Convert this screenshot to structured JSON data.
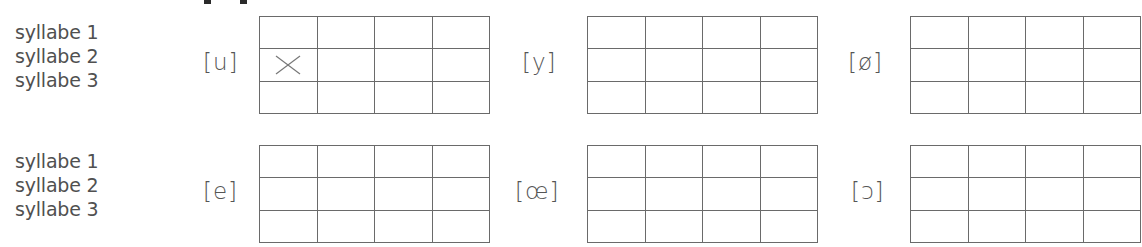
{
  "exercise": {
    "rows": [
      {
        "syllable_labels": [
          "syllabe 1",
          "syllabe 2",
          "syllabe 3"
        ],
        "grids": [
          {
            "phoneme": "[u]",
            "columns": 4,
            "rows": 3,
            "marks": [
              {
                "row": 2,
                "col": 1,
                "symbol": "×"
              }
            ]
          },
          {
            "phoneme": "[y]",
            "columns": 4,
            "rows": 3,
            "marks": []
          },
          {
            "phoneme": "[ø]",
            "columns": 4,
            "rows": 3,
            "marks": []
          }
        ]
      },
      {
        "syllable_labels": [
          "syllabe 1",
          "syllabe 2",
          "syllabe 3"
        ],
        "grids": [
          {
            "phoneme": "[e]",
            "columns": 4,
            "rows": 3,
            "marks": []
          },
          {
            "phoneme": "[œ]",
            "columns": 4,
            "rows": 3,
            "marks": []
          },
          {
            "phoneme": "[ɔ]",
            "columns": 4,
            "rows": 3,
            "marks": []
          }
        ]
      }
    ]
  }
}
